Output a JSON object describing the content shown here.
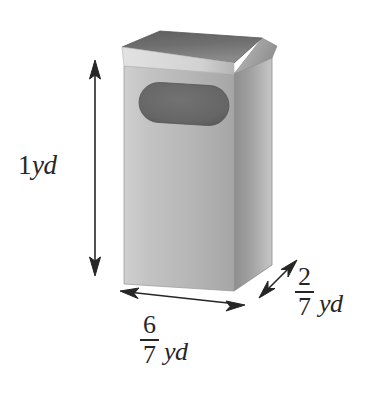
{
  "figure": {
    "kind": "technical-illustration",
    "background_color": "#ffffff",
    "ink_color": "#262626"
  },
  "object": {
    "name": "trash-receptacle",
    "parts": {
      "lid_top": "lid-top-surface",
      "lid_rim": "lid-front-rim",
      "front_face": "front-face",
      "side_face": "right-side-face",
      "slot": "oval-slot-opening"
    },
    "shading": {
      "front_face_color": "#bcbcbc",
      "side_face_color": "#9a9a9a",
      "lid_top_color": "#6e6e6e",
      "lid_rim_color": "#d4d4d4",
      "slot_color": "#6a6a6a"
    }
  },
  "dimensions": [
    {
      "id": "height",
      "name": "height-dimension",
      "arrow": "vertical-double-arrow",
      "value": "1",
      "unit": "yd",
      "display": "1 yd",
      "is_fraction": false
    },
    {
      "id": "width",
      "name": "width-dimension",
      "arrow": "horizontal-double-arrow",
      "numerator": "6",
      "denominator": "7",
      "unit": "yd",
      "display": "6/7 yd",
      "is_fraction": true
    },
    {
      "id": "depth",
      "name": "depth-dimension",
      "arrow": "diagonal-double-arrow",
      "numerator": "2",
      "denominator": "7",
      "unit": "yd",
      "display": "2/7 yd",
      "is_fraction": true
    }
  ],
  "labels": {
    "height": {
      "number": "1",
      "unit": "yd"
    },
    "width": {
      "numerator": "6",
      "denominator": "7",
      "unit": "yd"
    },
    "depth": {
      "numerator": "2",
      "denominator": "7",
      "unit": "yd"
    }
  }
}
